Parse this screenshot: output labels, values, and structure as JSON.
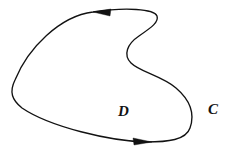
{
  "figure": {
    "background_color": "#ffffff",
    "stroke_color": "#121212",
    "stroke_width": 1.35,
    "width": 233,
    "height": 153
  },
  "labels": {
    "curve_label": "C",
    "region_label": "D"
  },
  "orientation": {
    "direction": "counterclockwise",
    "top_arrow_points": "left",
    "bottom_arrow_points": "right"
  },
  "geometry": {
    "curve_path": "M 93 12 C 60 16 28 48 15 80 C 9 92 12 100 22 108 C 50 127 110 141 146 142 C 168 142 186 140 190 128 C 195 114 190 100 176 88 C 162 76 140 72 131 63 C 123 55 127 44 139 36 C 152 27 159 22 157 16 C 154 9 126 7 93 12 Z",
    "top_arrow": {
      "tip": [
        93,
        12
      ],
      "points": "93,12 111,9 110,16"
    },
    "bottom_arrow": {
      "tip": [
        152,
        142
      ],
      "points": "152,142 133,138 134,145"
    },
    "extremes": {
      "leftmost": [
        13,
        95
      ],
      "rightmost": [
        193,
        110
      ],
      "right_bulge": [
        158,
        25
      ],
      "notch_inner": [
        127,
        60
      ],
      "bottom_right_turn": [
        190,
        130
      ]
    }
  }
}
